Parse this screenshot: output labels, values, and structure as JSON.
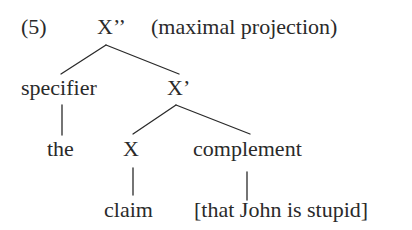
{
  "example_number": "(5)",
  "nodes": {
    "root": {
      "label": "X’’",
      "annotation": "(maximal projection)"
    },
    "specifier": {
      "label": "specifier"
    },
    "x_bar": {
      "label": "X’"
    },
    "the": {
      "label": "the"
    },
    "x_head": {
      "label": "X"
    },
    "complement": {
      "label": "complement"
    },
    "claim": {
      "label": "claim"
    },
    "clause": {
      "label": "[that John is stupid]"
    }
  },
  "edges": [
    [
      "root",
      "specifier"
    ],
    [
      "root",
      "x_bar"
    ],
    [
      "specifier",
      "the"
    ],
    [
      "x_bar",
      "x_head"
    ],
    [
      "x_bar",
      "complement"
    ],
    [
      "x_head",
      "claim"
    ],
    [
      "complement",
      "clause"
    ]
  ],
  "colors": {
    "ink": "#2a2a2a",
    "background": "#ffffff"
  }
}
